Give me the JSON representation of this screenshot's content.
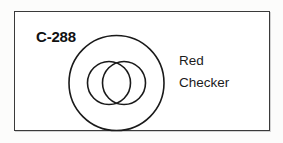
{
  "card": {
    "code": "C-288",
    "caption_lines": [
      "Red",
      "Checker"
    ],
    "border_color": "#3a3a3a",
    "background_color": "#ffffff",
    "text_color": "#111111"
  },
  "diagram": {
    "type": "line-drawing",
    "stroke_color": "#1a1a1a",
    "fill": "none",
    "outer_circle": {
      "cx": 51.5,
      "cy": 55,
      "r": 47.5
    },
    "inner_circles": [
      {
        "cx": 44,
        "cy": 55,
        "r": 21.5
      },
      {
        "cx": 59,
        "cy": 55,
        "r": 21.5
      }
    ]
  }
}
